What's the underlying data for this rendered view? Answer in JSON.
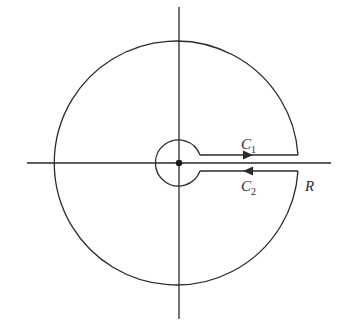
{
  "diagram": {
    "labels": {
      "c1": {
        "main": "C",
        "sub": "1"
      },
      "c2": {
        "main": "C",
        "sub": "2"
      },
      "r": "R"
    },
    "elements": [
      "real-axis",
      "imaginary-axis",
      "outer-arc-radius-R",
      "inner-small-circle",
      "upper-segment-C1",
      "lower-segment-C2",
      "origin-point",
      "arrow-right-on-C1",
      "arrow-left-on-C2"
    ],
    "color": "#2a2a2a"
  }
}
